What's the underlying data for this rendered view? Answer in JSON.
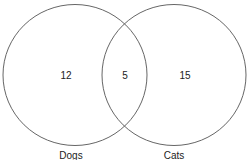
{
  "diagram": {
    "type": "venn",
    "sets": [
      {
        "name": "Dogs",
        "only_count": "12"
      },
      {
        "name": "Cats",
        "only_count": "15"
      }
    ],
    "intersection_count": "5",
    "stroke_color": "#666666"
  }
}
